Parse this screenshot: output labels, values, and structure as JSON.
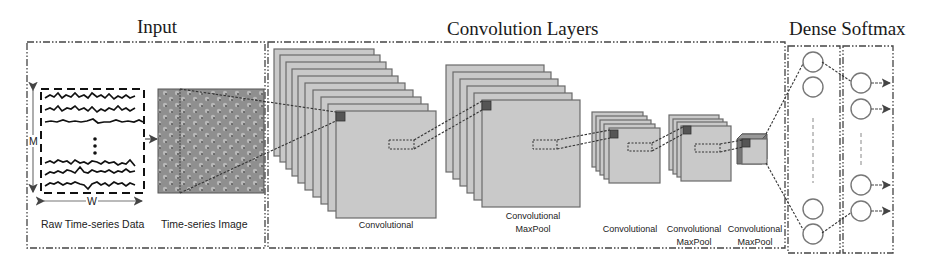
{
  "titles": {
    "input": "Input",
    "convolution": "Convolution Layers",
    "dense_softmax": "Dense Softmax"
  },
  "input": {
    "raw_label": "Raw Time-series Data",
    "image_label": "Time-series Image",
    "axis_m": "M",
    "axis_w": "W"
  },
  "conv_layers": [
    {
      "label_line1": "Convolutional",
      "label_line2": ""
    },
    {
      "label_line1": "Convolutional",
      "label_line2": "MaxPool"
    },
    {
      "label_line1": "Convolutional",
      "label_line2": ""
    },
    {
      "label_line1": "Convolutional",
      "label_line2": "MaxPool"
    },
    {
      "label_line1": "Convolutional",
      "label_line2": "MaxPool"
    }
  ],
  "colors": {
    "layer_fill": "#c9c9c9",
    "layer_stroke": "#6b6b6b",
    "kernel": "#555555",
    "image_fill": "#8f8f8f"
  }
}
